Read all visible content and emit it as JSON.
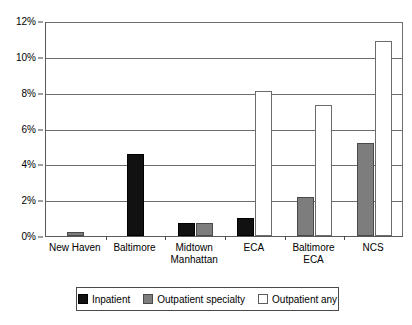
{
  "chart_data": {
    "type": "bar",
    "title": "",
    "subtitle": "",
    "xlabel": "",
    "ylabel": "",
    "ylim": [
      0,
      12
    ],
    "ytick_labels": [
      "0%",
      "2%",
      "4%",
      "6%",
      "8%",
      "10%",
      "12%"
    ],
    "ytick_values": [
      0,
      2,
      4,
      6,
      8,
      10,
      12
    ],
    "grid": true,
    "legend_position": "bottom",
    "categories": [
      "New Haven",
      "Baltimore",
      "Midtown\nManhattan",
      "ECA",
      "Baltimore\nECA",
      "NCS"
    ],
    "series": [
      {
        "name": "Inpatient",
        "color": "#111111",
        "values": [
          null,
          4.6,
          0.7,
          1.0,
          null,
          null
        ]
      },
      {
        "name": "Outpatient specialty",
        "color": "#7d7d7d",
        "values": [
          0.2,
          null,
          0.7,
          null,
          2.2,
          5.2
        ]
      },
      {
        "name": "Outpatient any",
        "color": "#ffffff",
        "values": [
          null,
          null,
          null,
          8.1,
          7.3,
          10.9
        ]
      }
    ]
  },
  "legend": {
    "items": [
      {
        "label": "Inpatient",
        "swatch": "inpatient"
      },
      {
        "label": "Outpatient specialty",
        "swatch": "specialty"
      },
      {
        "label": "Outpatient any",
        "swatch": "any"
      }
    ]
  }
}
